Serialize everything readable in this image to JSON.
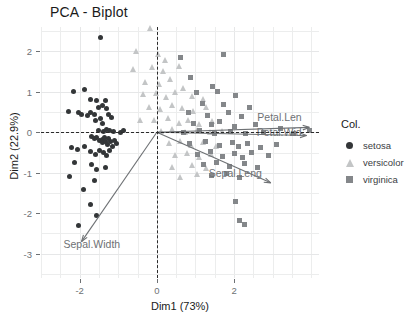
{
  "title": "PCA - Biplot",
  "axes": {
    "x": {
      "label": "Dim1 (73%)",
      "ticks": [
        "-2",
        "0",
        "2"
      ]
    },
    "y": {
      "label": "Dim2 (22.9%)",
      "ticks": [
        "2",
        "1",
        "0",
        "-1",
        "-2",
        "-3"
      ]
    }
  },
  "legend": {
    "title": "Col.",
    "items": [
      {
        "label": "setosa",
        "marker": "circle-icon",
        "color": "#333638"
      },
      {
        "label": "versicolor",
        "marker": "triangle-icon",
        "color": "#c3c5c6"
      },
      {
        "label": "virginica",
        "marker": "square-icon",
        "color": "#84878a"
      }
    ]
  },
  "chart_data": {
    "type": "scatter",
    "title": "PCA - Biplot",
    "xlabel": "Dim1 (73%)",
    "ylabel": "Dim2 (22.9%)",
    "xlim": [
      -3.0,
      4.2
    ],
    "ylim": [
      -3.6,
      2.6
    ],
    "xticks": [
      -2,
      0,
      2
    ],
    "yticks": [
      -3,
      -2,
      -1,
      0,
      1,
      2
    ],
    "grid": true,
    "legend_position": "right",
    "reference_lines": [
      {
        "orientation": "vertical",
        "value": 0,
        "style": "dashed",
        "color": "#2b2b2b"
      },
      {
        "orientation": "horizontal",
        "value": 0,
        "style": "dashed",
        "color": "#2b2b2b"
      }
    ],
    "series": [
      {
        "name": "setosa",
        "marker": "circle",
        "color": "#333638",
        "points": [
          [
            -1.45,
            2.35
          ],
          [
            -2.15,
            1.0
          ],
          [
            -1.88,
            1.05
          ],
          [
            -1.72,
            0.8
          ],
          [
            -1.55,
            0.78
          ],
          [
            -1.5,
            0.6
          ],
          [
            -1.42,
            0.66
          ],
          [
            -1.33,
            0.78
          ],
          [
            -1.3,
            0.58
          ],
          [
            -2.3,
            0.52
          ],
          [
            -2.02,
            0.5
          ],
          [
            -1.95,
            0.45
          ],
          [
            -1.8,
            0.42
          ],
          [
            -1.72,
            0.48
          ],
          [
            -1.62,
            0.44
          ],
          [
            -1.58,
            0.3
          ],
          [
            -1.45,
            0.35
          ],
          [
            -1.4,
            0.22
          ],
          [
            -1.25,
            0.44
          ],
          [
            -1.18,
            0.36
          ],
          [
            -1.52,
            0.05
          ],
          [
            -1.38,
            0.02
          ],
          [
            -1.3,
            0.08
          ],
          [
            -1.22,
            0.04
          ],
          [
            -1.12,
            0.02
          ],
          [
            -0.95,
            0.0
          ],
          [
            -0.86,
            0.05
          ],
          [
            -1.7,
            -0.1
          ],
          [
            -1.62,
            -0.15
          ],
          [
            -1.55,
            -0.12
          ],
          [
            -1.48,
            -0.2
          ],
          [
            -1.42,
            -0.18
          ],
          [
            -1.4,
            -0.26
          ],
          [
            -1.35,
            -0.14
          ],
          [
            -1.32,
            -0.22
          ],
          [
            -1.28,
            -0.3
          ],
          [
            -1.25,
            -0.16
          ],
          [
            -1.2,
            -0.24
          ],
          [
            -1.15,
            -0.34
          ],
          [
            -1.1,
            -0.2
          ],
          [
            -1.05,
            -0.28
          ],
          [
            -2.22,
            -0.38
          ],
          [
            -2.05,
            -0.42
          ],
          [
            -1.88,
            -0.35
          ],
          [
            -1.72,
            -0.48
          ],
          [
            -1.6,
            -0.55
          ],
          [
            -1.48,
            -0.44
          ],
          [
            -1.38,
            -0.5
          ],
          [
            -1.3,
            -0.58
          ],
          [
            -1.22,
            -0.46
          ],
          [
            -2.12,
            -0.74
          ],
          [
            -1.7,
            -0.8
          ],
          [
            -1.55,
            -0.92
          ],
          [
            -1.32,
            -0.88
          ],
          [
            -2.25,
            -1.1
          ],
          [
            -1.62,
            -1.18
          ],
          [
            -1.9,
            -1.42
          ],
          [
            -1.72,
            -1.78
          ],
          [
            -1.55,
            -2.05
          ],
          [
            -2.02,
            -2.3
          ]
        ]
      },
      {
        "name": "versicolor",
        "marker": "triangle",
        "color": "#c3c5c6",
        "points": [
          [
            -0.15,
            2.55
          ],
          [
            -0.52,
            2.0
          ],
          [
            0.05,
            1.92
          ],
          [
            0.22,
            1.78
          ],
          [
            -0.6,
            1.55
          ],
          [
            -0.1,
            1.6
          ],
          [
            0.18,
            1.5
          ],
          [
            0.6,
            1.62
          ],
          [
            -0.28,
            1.22
          ],
          [
            0.08,
            1.18
          ],
          [
            0.35,
            1.3
          ],
          [
            0.7,
            1.08
          ],
          [
            -0.35,
            0.92
          ],
          [
            0.0,
            0.95
          ],
          [
            0.25,
            0.86
          ],
          [
            0.48,
            0.98
          ],
          [
            0.92,
            0.88
          ],
          [
            1.2,
            0.8
          ],
          [
            -0.2,
            0.62
          ],
          [
            0.1,
            0.55
          ],
          [
            0.4,
            0.66
          ],
          [
            0.68,
            0.58
          ],
          [
            0.95,
            0.5
          ],
          [
            1.28,
            0.62
          ],
          [
            -0.42,
            0.3
          ],
          [
            -0.05,
            0.28
          ],
          [
            0.3,
            0.34
          ],
          [
            0.58,
            0.22
          ],
          [
            0.82,
            0.3
          ],
          [
            1.1,
            0.18
          ],
          [
            1.45,
            0.26
          ],
          [
            0.12,
            0.02
          ],
          [
            0.42,
            0.06
          ],
          [
            0.75,
            0.0
          ],
          [
            1.05,
            0.04
          ],
          [
            1.4,
            0.0
          ],
          [
            1.7,
            0.02
          ],
          [
            0.32,
            -0.28
          ],
          [
            0.62,
            -0.22
          ],
          [
            0.9,
            -0.32
          ],
          [
            1.22,
            -0.25
          ],
          [
            1.55,
            -0.35
          ],
          [
            0.48,
            -0.58
          ],
          [
            0.8,
            -0.52
          ],
          [
            1.12,
            -0.62
          ],
          [
            1.42,
            -0.55
          ],
          [
            0.4,
            -0.88
          ],
          [
            0.92,
            -0.82
          ],
          [
            1.3,
            -0.9
          ],
          [
            0.62,
            -1.12
          ],
          [
            1.05,
            -1.05
          ]
        ]
      },
      {
        "name": "virginica",
        "marker": "square",
        "color": "#84878a",
        "points": [
          [
            0.62,
            1.85
          ],
          [
            1.72,
            1.92
          ],
          [
            0.88,
            1.35
          ],
          [
            1.45,
            1.12
          ],
          [
            1.02,
            0.98
          ],
          [
            1.58,
            1.0
          ],
          [
            2.05,
            0.9
          ],
          [
            1.18,
            0.72
          ],
          [
            1.72,
            0.68
          ],
          [
            2.4,
            0.62
          ],
          [
            0.82,
            0.48
          ],
          [
            1.3,
            0.42
          ],
          [
            1.85,
            0.5
          ],
          [
            2.18,
            0.38
          ],
          [
            0.95,
            0.22
          ],
          [
            1.42,
            0.18
          ],
          [
            1.62,
            0.26
          ],
          [
            2.02,
            0.14
          ],
          [
            2.55,
            0.2
          ],
          [
            3.2,
            0.1
          ],
          [
            0.7,
            0.0
          ],
          [
            1.1,
            0.04
          ],
          [
            1.5,
            -0.02
          ],
          [
            1.9,
            0.02
          ],
          [
            2.3,
            -0.04
          ],
          [
            2.75,
            0.0
          ],
          [
            3.55,
            -0.02
          ],
          [
            3.95,
            0.05
          ],
          [
            0.85,
            -0.28
          ],
          [
            1.25,
            -0.22
          ],
          [
            1.62,
            -0.32
          ],
          [
            1.95,
            -0.25
          ],
          [
            2.12,
            -0.36
          ],
          [
            2.35,
            -0.28
          ],
          [
            2.68,
            -0.38
          ],
          [
            3.1,
            -0.3
          ],
          [
            1.05,
            -0.55
          ],
          [
            1.38,
            -0.48
          ],
          [
            1.7,
            -0.6
          ],
          [
            2.0,
            -0.52
          ],
          [
            2.22,
            -0.62
          ],
          [
            2.45,
            -0.5
          ],
          [
            2.9,
            -0.58
          ],
          [
            1.2,
            -0.8
          ],
          [
            1.55,
            -0.75
          ],
          [
            1.88,
            -0.85
          ],
          [
            2.28,
            -0.78
          ],
          [
            2.62,
            -0.88
          ],
          [
            1.42,
            -1.08
          ],
          [
            1.8,
            -1.02
          ],
          [
            2.15,
            -1.12
          ],
          [
            2.05,
            -1.72
          ],
          [
            2.15,
            -2.18
          ],
          [
            2.28,
            -2.28
          ]
        ]
      }
    ],
    "loadings": [
      {
        "label": "Petal.Len",
        "x": 3.95,
        "y": 0.12,
        "arrow_color": "#6e7174"
      },
      {
        "label": "Petal.Wid",
        "x": 3.88,
        "y": -0.08,
        "arrow_color": "#6e7174"
      },
      {
        "label": "Sepal.Leng",
        "x": 2.95,
        "y": -1.25,
        "arrow_color": "#6e7174"
      },
      {
        "label": "Sepal.Width",
        "x": -1.95,
        "y": -2.7,
        "arrow_color": "#6e7174"
      }
    ]
  }
}
